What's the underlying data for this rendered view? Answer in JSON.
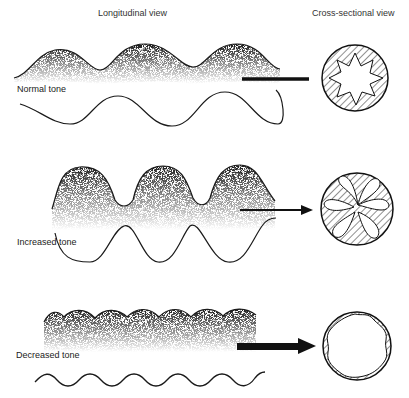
{
  "headers": {
    "longitudinal": "Longitudinal view",
    "cross_sectional": "Cross-sectional view"
  },
  "panels": [
    {
      "id": "normal",
      "label": "Normal tone",
      "connector": "bar",
      "cross_section": "star-lumen"
    },
    {
      "id": "increased",
      "label": "Increased tone",
      "connector": "arrow",
      "cross_section": "petal-lumen"
    },
    {
      "id": "decreased",
      "label": "Decreased tone",
      "connector": "thick-arrow",
      "cross_section": "open-lumen"
    }
  ],
  "colors": {
    "ink": "#1a1a1a",
    "stipple": "#555555",
    "paper": "#ffffff"
  }
}
